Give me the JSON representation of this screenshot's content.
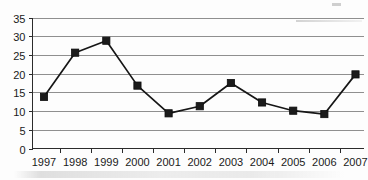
{
  "chart_data": {
    "type": "line",
    "title": "",
    "subtitle": "",
    "xlabel": "",
    "ylabel": "",
    "categories": [
      "1997",
      "1998",
      "1999",
      "2000",
      "2001",
      "2002",
      "2003",
      "2004",
      "2005",
      "2006",
      "2007"
    ],
    "values": [
      13.8,
      25.6,
      28.8,
      16.8,
      9.4,
      11.3,
      17.5,
      12.3,
      10.1,
      9.2,
      19.8
    ],
    "series": [
      {
        "name": "Series 1",
        "values": [
          13.8,
          25.6,
          28.8,
          16.8,
          9.4,
          11.3,
          17.5,
          12.3,
          10.1,
          9.2,
          19.8
        ]
      }
    ],
    "ylim": [
      0,
      35
    ],
    "y_ticks": [
      0,
      5,
      10,
      15,
      20,
      25,
      30,
      35
    ],
    "y_tick_labels": [
      "0",
      "5",
      "10",
      "15",
      "20",
      "25",
      "30",
      "35"
    ],
    "x_tick_labels": [
      "1997",
      "1998",
      "1999",
      "2000",
      "2001",
      "2002",
      "2003",
      "2004",
      "2005",
      "2006",
      "2007"
    ],
    "grid": true,
    "grid_axis": "y",
    "legend": false,
    "legend_position": "none",
    "marker": "square",
    "colors": {
      "line": "#161616",
      "marker": "#1b1b1b",
      "grid": "#8f8f8f",
      "axis": "#2b2b2b",
      "background": "#fdfdfd",
      "text": "#1a1a1a"
    },
    "annotations": []
  },
  "figure": {
    "name": "line-chart-1997-2007",
    "artifact_note": "scanned-page-artifacts"
  }
}
